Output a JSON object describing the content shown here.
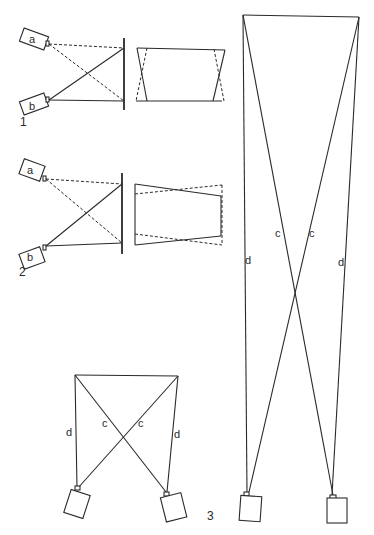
{
  "figure": {
    "panel_1": {
      "number": "1",
      "camera_a": "a",
      "camera_b": "b"
    },
    "panel_2": {
      "number": "2",
      "camera_a": "a",
      "camera_b": "b"
    },
    "panel_3": {
      "number": "3",
      "label_c": "c",
      "label_d": "d"
    },
    "colors": {
      "line": "#2a2a2a",
      "background": "#ffffff"
    }
  }
}
